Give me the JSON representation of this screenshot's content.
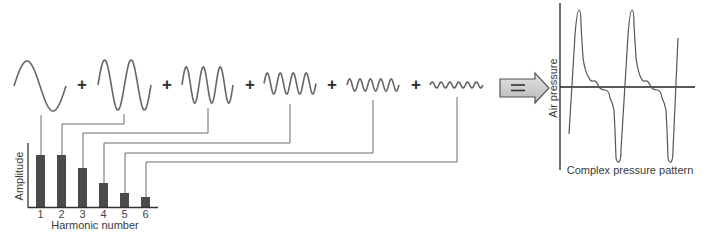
{
  "figure": {
    "operators": {
      "plus": "+",
      "equals": "="
    },
    "harmonic_waves": [
      {
        "harmonic": 1,
        "cycles": 1,
        "x0": 14,
        "x1": 66,
        "amp": 25,
        "cy": 86
      },
      {
        "harmonic": 2,
        "cycles": 2,
        "x0": 98,
        "x1": 151,
        "amp": 25,
        "cy": 85
      },
      {
        "harmonic": 3,
        "cycles": 3,
        "x0": 182,
        "x1": 233,
        "amp": 18,
        "cy": 85
      },
      {
        "harmonic": 4,
        "cycles": 4,
        "x0": 264,
        "x1": 316,
        "amp": 10.5,
        "cy": 83.5
      },
      {
        "harmonic": 5,
        "cycles": 5,
        "x0": 347,
        "x1": 399,
        "amp": 6,
        "cy": 85
      },
      {
        "harmonic": 6,
        "cycles": 6,
        "x0": 430,
        "x1": 483,
        "amp": 3,
        "cy": 85
      }
    ],
    "plus_positions": [
      82,
      167,
      250,
      332,
      416
    ],
    "arrow": {
      "label": "=",
      "fill": "#cfcfcf",
      "stroke": "#555555"
    },
    "pressure_graph": {
      "y_axis_label": "Air pressure",
      "caption": "Complex pressure pattern"
    }
  },
  "chart_data": {
    "type": "bar",
    "title": "",
    "xlabel": "Harmonic number",
    "ylabel": "Amplitude",
    "categories": [
      "1",
      "2",
      "3",
      "4",
      "5",
      "6"
    ],
    "values": [
      52,
      52,
      39,
      24,
      14,
      10
    ],
    "ylim": [
      0,
      64
    ],
    "grid": false,
    "legend": null,
    "bar_color": "#4a4a4a",
    "note": "Values are relative bar heights in pixels (no numeric y-axis ticks shown)"
  }
}
